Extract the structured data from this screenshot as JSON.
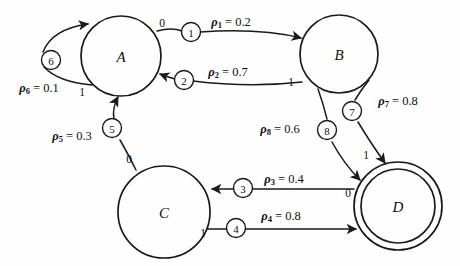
{
  "diagram": {
    "background_color": "#fefefe",
    "stroke_color": "#1a1a1a",
    "nodes": [
      {
        "id": "A",
        "label": "A",
        "cx": 121,
        "cy": 56,
        "r": 40,
        "accepting": false
      },
      {
        "id": "B",
        "label": "B",
        "cx": 339,
        "cy": 54,
        "r": 39,
        "accepting": false
      },
      {
        "id": "C",
        "label": "C",
        "cx": 164,
        "cy": 212,
        "r": 46,
        "accepting": false
      },
      {
        "id": "D",
        "label": "D",
        "cx": 398,
        "cy": 206,
        "r": 44,
        "accepting": true
      }
    ],
    "edges": [
      {
        "id": "e1",
        "from": "A",
        "to": "B",
        "marker": "1",
        "rho": "ρ",
        "sub": "1",
        "weight": "0.2",
        "label": "ρ₁ = 0.2",
        "symbol": "0"
      },
      {
        "id": "e2",
        "from": "B",
        "to": "A",
        "marker": "2",
        "rho": "ρ",
        "sub": "2",
        "weight": "0.7",
        "label": "ρ₂ = 0.7",
        "symbol": "1"
      },
      {
        "id": "e3",
        "from": "D",
        "to": "C",
        "marker": "3",
        "rho": "ρ",
        "sub": "3",
        "weight": "0.4",
        "label": "ρ₃ = 0.4",
        "symbol": "0"
      },
      {
        "id": "e4",
        "from": "C",
        "to": "D",
        "marker": "4",
        "rho": "ρ",
        "sub": "4",
        "weight": "0.8",
        "label": "ρ₄ = 0.8",
        "symbol": "1"
      },
      {
        "id": "e5",
        "from": "C",
        "to": "A",
        "marker": "5",
        "rho": "ρ",
        "sub": "5",
        "weight": "0.3",
        "label": "ρ₅ = 0.3",
        "symbol": "0"
      },
      {
        "id": "e6",
        "from": "A",
        "to": "A",
        "marker": "6",
        "rho": "ρ",
        "sub": "6",
        "weight": "0.1",
        "label": "ρ₆ = 0.1",
        "symbol": "1"
      },
      {
        "id": "e7",
        "from": "B",
        "to": "D",
        "marker": "7",
        "rho": "ρ",
        "sub": "7",
        "weight": "0.8",
        "label": "ρ₇ = 0.8",
        "symbol": ""
      },
      {
        "id": "e8",
        "from": "B",
        "to": "D",
        "marker": "8",
        "rho": "ρ",
        "sub": "8",
        "weight": "0.6",
        "label": "ρ₈ = 0.6",
        "symbol": "1"
      }
    ],
    "markers": [
      {
        "id": "m1",
        "text": "1",
        "cx": 191,
        "cy": 32
      },
      {
        "id": "m2",
        "text": "2",
        "cx": 184,
        "cy": 80
      },
      {
        "id": "m3",
        "text": "3",
        "cx": 243,
        "cy": 188
      },
      {
        "id": "m4",
        "text": "4",
        "cx": 236,
        "cy": 227
      },
      {
        "id": "m5",
        "text": "5",
        "cx": 112,
        "cy": 127
      },
      {
        "id": "m6",
        "text": "6",
        "cx": 51,
        "cy": 60
      },
      {
        "id": "m7",
        "text": "7",
        "cx": 352,
        "cy": 111
      },
      {
        "id": "m8",
        "text": "8",
        "cx": 327,
        "cy": 130
      }
    ],
    "symbols": [
      {
        "id": "s1",
        "text": "0",
        "x": 162,
        "y": 23,
        "edge": "e1"
      },
      {
        "id": "s2",
        "text": "1",
        "x": 291,
        "y": 82,
        "edge": "e2"
      },
      {
        "id": "s3",
        "text": "0",
        "x": 348,
        "y": 193,
        "edge": "e3"
      },
      {
        "id": "s4",
        "text": "1",
        "x": 203,
        "y": 233,
        "edge": "e4"
      },
      {
        "id": "s5",
        "text": "0",
        "x": 129,
        "y": 159,
        "edge": "e5"
      },
      {
        "id": "s6",
        "text": "1",
        "x": 82,
        "y": 92,
        "edge": "e6"
      },
      {
        "id": "s7",
        "text": "1",
        "x": 366,
        "y": 155,
        "edge": "e8"
      }
    ],
    "weights": [
      {
        "id": "w1",
        "edge": "e1",
        "x": 231,
        "y": 22
      },
      {
        "id": "w2",
        "edge": "e2",
        "x": 228,
        "y": 72
      },
      {
        "id": "w3",
        "edge": "e3",
        "x": 284,
        "y": 179
      },
      {
        "id": "w4",
        "edge": "e4",
        "x": 281,
        "y": 216
      },
      {
        "id": "w5",
        "edge": "e5",
        "x": 72,
        "y": 136
      },
      {
        "id": "w6",
        "edge": "e6",
        "x": 39,
        "y": 88
      },
      {
        "id": "w7",
        "edge": "e7",
        "x": 398,
        "y": 101
      },
      {
        "id": "w8",
        "edge": "e8",
        "x": 280,
        "y": 129
      }
    ]
  }
}
